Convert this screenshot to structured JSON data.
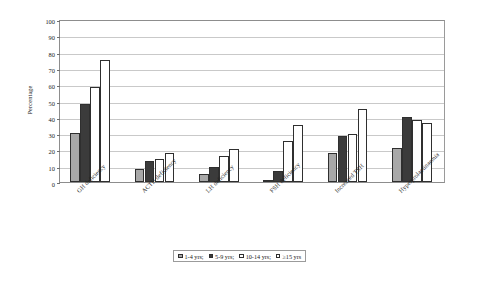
{
  "chart_data": {
    "type": "bar",
    "title": "",
    "xlabel": "",
    "ylabel": "Percentage",
    "ylim": [
      0,
      100
    ],
    "ytick_step": 10,
    "yticks": [
      "0",
      "10",
      "20",
      "30",
      "40",
      "50",
      "60",
      "70",
      "80",
      "90",
      "100"
    ],
    "grid": true,
    "legend_position": "bottom-center",
    "categories": [
      "GH deficiency",
      "ACTH deficiency",
      "LH deficiency",
      "FSH deficiency",
      "Increased TSH",
      "Hyperprolactinaemia"
    ],
    "series": [
      {
        "name": "1-4 yrs",
        "color": "#a8a8a8",
        "values": [
          30,
          8,
          5,
          1,
          18,
          21
        ]
      },
      {
        "name": "5-9 yrs",
        "color": "#3b3b3b",
        "values": [
          48,
          13,
          9.5,
          7,
          28,
          40
        ]
      },
      {
        "name": "10-14 yrs",
        "color": "#ffffff",
        "values": [
          58,
          14,
          16,
          25,
          29.5,
          38
        ]
      },
      {
        "name": "≥15 yrs",
        "color": "#ffffff",
        "values": [
          75,
          18,
          20,
          35,
          45,
          36.5
        ]
      }
    ],
    "legend_entries": [
      "1-4 yrs;",
      "5-9 yrs;",
      "10-14 yrs;",
      "≥15 yrs"
    ]
  },
  "colors": {
    "series_1": "#a8a8a8",
    "series_2": "#3b3b3b",
    "series_3": "#ffffff",
    "series_4": "#ffffff",
    "bar_outline": "#2f2f2f",
    "gridline": "#c9c9c9",
    "frame": "#8d8d8d",
    "background": "#ffffff"
  }
}
